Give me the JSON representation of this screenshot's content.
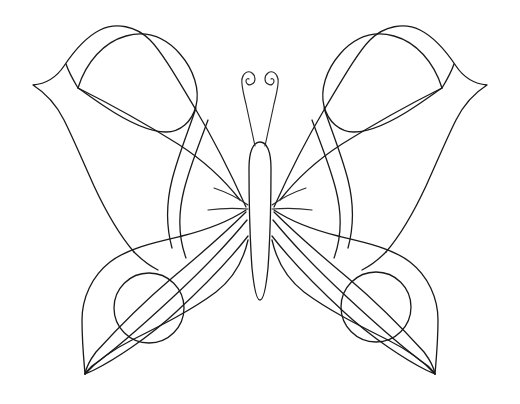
{
  "artwork": {
    "title": "Butterfly Coloring Page Line Drawing",
    "subject": "butterfly",
    "style": "black outline line art on white background",
    "canvas": {
      "width": 520,
      "height": 404,
      "background_color": "#ffffff"
    },
    "stroke_color": "#1a1a1a",
    "stroke_width": 1.3,
    "fill": "none",
    "symmetry": "bilateral about vertical axis x=260"
  },
  "parts": {
    "body": {
      "name": "body",
      "shape": "elongated vertical oval",
      "center_x": 260,
      "top_y": 142,
      "bottom_y": 300,
      "half_width": 11
    },
    "antenna_left": {
      "name": "left-antenna",
      "shape": "curved stem ending in inward spiral curl",
      "base": [
        254,
        146
      ],
      "tip": [
        242,
        76
      ]
    },
    "antenna_right": {
      "name": "right-antenna",
      "shape": "curved stem ending in inward spiral curl",
      "base": [
        266,
        146
      ],
      "tip": [
        278,
        76
      ]
    },
    "upper_wing_left": {
      "name": "upper-left-wing",
      "outer_tip": [
        33,
        85
      ],
      "inner_vertex": [
        78,
        88
      ],
      "hinge": [
        246,
        208
      ],
      "top_peak": [
        175,
        30
      ],
      "details": [
        "outer contour",
        "eye leaf panel",
        "long sweeping band",
        "inner curved vein"
      ]
    },
    "upper_wing_right": {
      "name": "upper-right-wing",
      "outer_tip": [
        487,
        85
      ],
      "inner_vertex": [
        442,
        88
      ],
      "hinge": [
        274,
        208
      ],
      "top_peak": [
        345,
        30
      ],
      "details": [
        "outer contour",
        "eye leaf panel",
        "long sweeping band",
        "inner curved vein"
      ]
    },
    "lower_wing_left": {
      "name": "lower-left-wing",
      "tip": [
        85,
        374
      ],
      "hinge": [
        246,
        208
      ],
      "details": [
        "outer teardrop contour",
        "three sweeping inner veins",
        "circle spot"
      ]
    },
    "lower_wing_right": {
      "name": "lower-right-wing",
      "tip": [
        435,
        374
      ],
      "hinge": [
        274,
        208
      ],
      "details": [
        "outer teardrop contour",
        "three sweeping inner veins",
        "circle spot"
      ]
    },
    "spot_left": {
      "name": "left-wing-spot",
      "shape": "circle",
      "cx": 149,
      "cy": 308,
      "r": 35
    },
    "spot_right": {
      "name": "right-wing-spot",
      "shape": "circle",
      "cx": 376,
      "cy": 307,
      "r": 35
    }
  }
}
